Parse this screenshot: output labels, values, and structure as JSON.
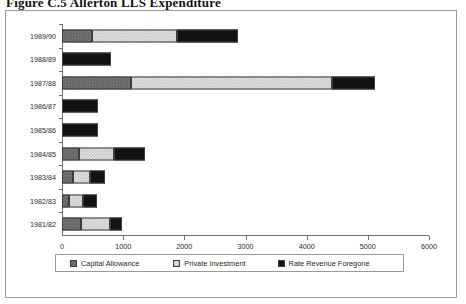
{
  "caption": "Figure C.5   Allerton LLS Expenditure",
  "chart_data": {
    "type": "bar",
    "orientation": "horizontal",
    "stacked": true,
    "title": "",
    "xlabel": "(000's) pounds",
    "ylabel": "",
    "xlim": [
      0,
      6000
    ],
    "xticks": [
      0,
      1000,
      2000,
      3000,
      4000,
      5000,
      6000
    ],
    "xticklabels": [
      "0",
      "1000",
      "2000",
      "3000",
      "4000",
      "5000",
      "6000"
    ],
    "grid": false,
    "legend_position": "bottom",
    "categories": [
      "1989/90",
      "1988/89",
      "1987/88",
      "1986/87",
      "1985/86",
      "1984/85",
      "1983/84",
      "1982/83",
      "1981/82"
    ],
    "series": [
      {
        "name": "Capital Allowance",
        "color": "#5e5e5e",
        "values": [
          490,
          0,
          1130,
          0,
          0,
          280,
          180,
          120,
          310
        ]
      },
      {
        "name": "Private Investment",
        "color": "#c9c9c9",
        "values": [
          1390,
          0,
          3290,
          0,
          0,
          570,
          280,
          230,
          480
        ]
      },
      {
        "name": "Rate Revenue Foregone",
        "color": "#121212",
        "values": [
          990,
          800,
          690,
          590,
          590,
          510,
          250,
          220,
          190
        ]
      }
    ],
    "totals": [
      2870,
      800,
      5110,
      590,
      590,
      1360,
      710,
      570,
      980
    ]
  },
  "legend": {
    "items": [
      {
        "label": "Capital Allowance",
        "swatch": "capital-allowance-swatch"
      },
      {
        "label": "Private Investment",
        "swatch": "private-investment-swatch"
      },
      {
        "label": "Rate Revenue Foregone",
        "swatch": "rate-revenue-foregone-swatch"
      }
    ]
  }
}
